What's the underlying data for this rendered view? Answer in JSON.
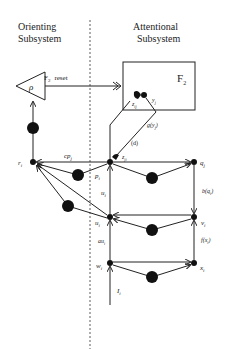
{
  "headers": {
    "orienting_line1": "Orienting",
    "orienting_line2": "Subsystem",
    "attentional_line1": "Attentional",
    "attentional_line2": "Subsystem"
  },
  "labels": {
    "rho": "ρ",
    "f2_box": "F",
    "f2_sub": "2",
    "reset_f": "F",
    "reset_sub": "2",
    "reset_text": "reset",
    "z_ij": "z",
    "z_ij_sub": "ij",
    "y_j": "y",
    "y_j_sub": "j",
    "g_yj": "g(y",
    "g_yj_close": "j",
    "d": "(d)",
    "z_ji": "z",
    "z_ji_sub": "ji",
    "r_i": "r",
    "r_i_sub": "i",
    "cp_j": "cp",
    "cp_j_sub": "j",
    "p_i": "p",
    "p_i_sub": "i",
    "q_j": "q",
    "q_j_sub": "j",
    "b_q": "b(q",
    "b_q_sub": "i",
    "u_i_up": "u",
    "u_i_up_sub": "i",
    "u_i": "u",
    "u_i_sub": "i",
    "v_i": "v",
    "v_i_sub": "i",
    "f_x": "f(x",
    "f_x_sub": "i",
    "au_i": "au",
    "au_i_sub": "i",
    "w_i": "w",
    "w_i_sub": "i",
    "x_i": "x",
    "x_i_sub": "i",
    "I_i": "I",
    "I_i_sub": "i"
  },
  "colors": {
    "ink": "#222222",
    "background": "#ffffff"
  }
}
